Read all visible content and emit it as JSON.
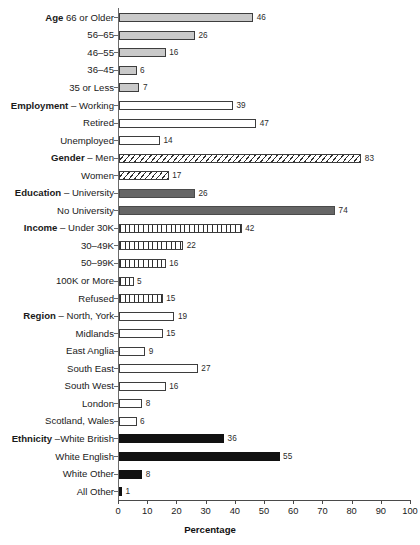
{
  "chart_data": {
    "type": "bar",
    "orientation": "horizontal",
    "title": "",
    "xlabel": "Percentage",
    "ylabel": "",
    "xlim": [
      0,
      100
    ],
    "xticks": [
      0,
      10,
      20,
      30,
      40,
      50,
      60,
      70,
      80,
      90,
      100
    ],
    "grid": false,
    "legend": false,
    "categories": [
      "Age 66 or Older",
      "56–65",
      "46–55",
      "36–45",
      "35 or Less",
      "Employment – Working",
      "Retired",
      "Unemployed",
      "Gender – Men",
      "Women",
      "Education – University",
      "No University",
      "Income – Under 30K",
      "30–49K",
      "50–99K",
      "100K or More",
      "Refused",
      "Region – North, York",
      "Midlands",
      "East Anglia",
      "South East",
      "South West",
      "London",
      "Scotland, Wales",
      "Ethnicity –White British",
      "White English",
      "White Other",
      "All Other"
    ],
    "values": [
      46,
      26,
      16,
      6,
      7,
      39,
      47,
      14,
      83,
      17,
      26,
      74,
      42,
      22,
      16,
      5,
      15,
      19,
      15,
      9,
      27,
      16,
      8,
      6,
      36,
      55,
      8,
      1
    ],
    "rows": [
      {
        "group": "Age",
        "sep": " ",
        "label": "66 or Older",
        "value": 46,
        "fill": "fill-lightgray"
      },
      {
        "group": "",
        "sep": "",
        "label": "56–65",
        "value": 26,
        "fill": "fill-lightgray"
      },
      {
        "group": "",
        "sep": "",
        "label": "46–55",
        "value": 16,
        "fill": "fill-lightgray"
      },
      {
        "group": "",
        "sep": "",
        "label": "36–45",
        "value": 6,
        "fill": "fill-lightgray"
      },
      {
        "group": "",
        "sep": "",
        "label": "35 or Less",
        "value": 7,
        "fill": "fill-lightgray"
      },
      {
        "group": "Employment",
        "sep": " – ",
        "label": "Working",
        "value": 39,
        "fill": "fill-white"
      },
      {
        "group": "",
        "sep": "",
        "label": "Retired",
        "value": 47,
        "fill": "fill-white"
      },
      {
        "group": "",
        "sep": "",
        "label": "Unemployed",
        "value": 14,
        "fill": "fill-white"
      },
      {
        "group": "Gender",
        "sep": " – ",
        "label": "Men",
        "value": 83,
        "fill": "fill-diag"
      },
      {
        "group": "",
        "sep": "",
        "label": "Women",
        "value": 17,
        "fill": "fill-diag"
      },
      {
        "group": "Education",
        "sep": " – ",
        "label": "University",
        "value": 26,
        "fill": "fill-darkgray"
      },
      {
        "group": "",
        "sep": "",
        "label": "No University",
        "value": 74,
        "fill": "fill-darkgray"
      },
      {
        "group": "Income",
        "sep": " – ",
        "label": "Under 30K",
        "value": 42,
        "fill": "fill-vert"
      },
      {
        "group": "",
        "sep": "",
        "label": "30–49K",
        "value": 22,
        "fill": "fill-vert"
      },
      {
        "group": "",
        "sep": "",
        "label": "50–99K",
        "value": 16,
        "fill": "fill-vert"
      },
      {
        "group": "",
        "sep": "",
        "label": "100K or More",
        "value": 5,
        "fill": "fill-vert"
      },
      {
        "group": "",
        "sep": "",
        "label": "Refused",
        "value": 15,
        "fill": "fill-vert"
      },
      {
        "group": "Region",
        "sep": " – ",
        "label": "North, York",
        "value": 19,
        "fill": "fill-white"
      },
      {
        "group": "",
        "sep": "",
        "label": "Midlands",
        "value": 15,
        "fill": "fill-white"
      },
      {
        "group": "",
        "sep": "",
        "label": "East Anglia",
        "value": 9,
        "fill": "fill-white"
      },
      {
        "group": "",
        "sep": "",
        "label": "South East",
        "value": 27,
        "fill": "fill-white"
      },
      {
        "group": "",
        "sep": "",
        "label": "South West",
        "value": 16,
        "fill": "fill-white"
      },
      {
        "group": "",
        "sep": "",
        "label": "London",
        "value": 8,
        "fill": "fill-white"
      },
      {
        "group": "",
        "sep": "",
        "label": "Scotland, Wales",
        "value": 6,
        "fill": "fill-white"
      },
      {
        "group": "Ethnicity",
        "sep": " –",
        "label": "White British",
        "value": 36,
        "fill": "fill-black"
      },
      {
        "group": "",
        "sep": "",
        "label": "White English",
        "value": 55,
        "fill": "fill-black"
      },
      {
        "group": "",
        "sep": "",
        "label": "White Other",
        "value": 8,
        "fill": "fill-black"
      },
      {
        "group": "",
        "sep": "",
        "label": "All Other",
        "value": 1,
        "fill": "fill-black"
      }
    ],
    "colors": {
      "age": "#c9c9c9",
      "employment": "#ffffff",
      "gender": "#ffffff",
      "education": "#666666",
      "income": "#ffffff",
      "region": "#ffffff",
      "ethnicity": "#111111",
      "outline": "#3d3d3d",
      "axis": "#4a4a4a",
      "text": "#1a1a1a"
    }
  }
}
